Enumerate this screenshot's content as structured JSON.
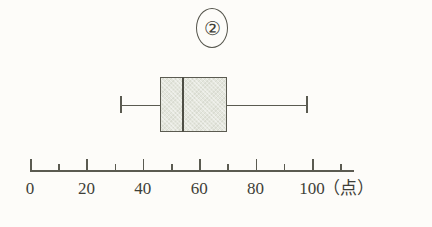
{
  "figure": {
    "label": "②",
    "label_name": "circled-number-2"
  },
  "chart_data": {
    "type": "box",
    "title": "②",
    "xlabel": "（点）",
    "ylabel": "",
    "xlim": [
      0,
      115
    ],
    "grid": false,
    "legend": "none",
    "orientation": "horizontal",
    "axis": {
      "unit_label": "（点）",
      "major_tick_step": 20,
      "minor_tick_step": 10,
      "tick_labels": [
        "0",
        "20",
        "40",
        "60",
        "80",
        "100"
      ],
      "tick_values": [
        0,
        20,
        40,
        60,
        80,
        100
      ],
      "minor_tick_values": [
        10,
        30,
        50,
        70,
        90,
        110
      ]
    },
    "boxes": [
      {
        "name": "②",
        "min": 32,
        "q1": 46,
        "median": 54,
        "q3": 70,
        "max": 98
      }
    ]
  },
  "colors": {
    "ink": "#4a4a42",
    "line": "#5b5b51",
    "box_fill": "#e4e6dd",
    "background": "#fdfcf9"
  }
}
